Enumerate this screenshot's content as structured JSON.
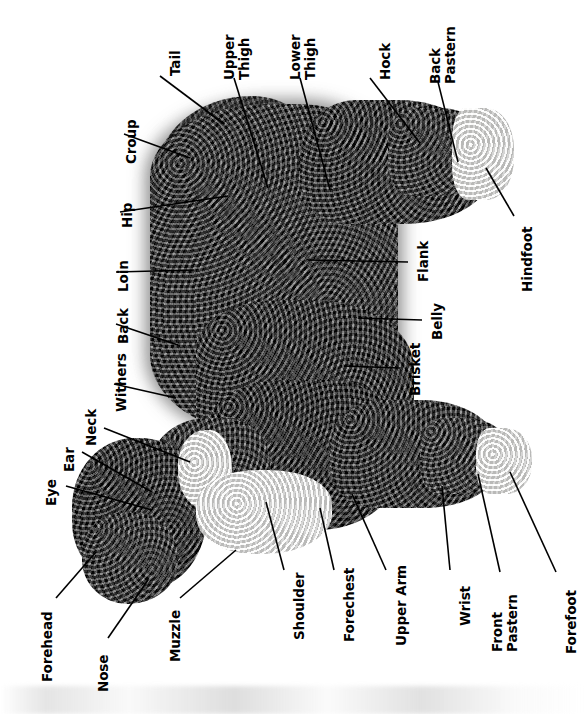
{
  "diagram": {
    "orientation": "rotated-90",
    "background_color": "#ffffff",
    "label_color": "#000000",
    "leader_color": "#000000"
  },
  "labels": [
    {
      "id": "tail",
      "lines": [
        "Tail"
      ],
      "text": "Tail"
    },
    {
      "id": "upper-thigh",
      "lines": [
        "Upper",
        "Thigh"
      ],
      "text": "Upper Thigh"
    },
    {
      "id": "lower-thigh",
      "lines": [
        "Lower",
        "Thigh"
      ],
      "text": "Lower Thigh"
    },
    {
      "id": "hock",
      "lines": [
        "Hock"
      ],
      "text": "Hock"
    },
    {
      "id": "back-pastern",
      "lines": [
        "Back",
        "Pastern"
      ],
      "text": "Back Pastern"
    },
    {
      "id": "croup",
      "lines": [
        "Croup"
      ],
      "text": "Croup"
    },
    {
      "id": "hip",
      "lines": [
        "Hip"
      ],
      "text": "Hip"
    },
    {
      "id": "loin",
      "lines": [
        "Loin"
      ],
      "text": "Loin"
    },
    {
      "id": "back",
      "lines": [
        "Back"
      ],
      "text": "Back"
    },
    {
      "id": "withers",
      "lines": [
        "Withers"
      ],
      "text": "Withers"
    },
    {
      "id": "neck",
      "lines": [
        "Neck"
      ],
      "text": "Neck"
    },
    {
      "id": "ear",
      "lines": [
        "Ear"
      ],
      "text": "Ear"
    },
    {
      "id": "eye",
      "lines": [
        "Eye"
      ],
      "text": "Eye"
    },
    {
      "id": "forehead",
      "lines": [
        "Forehead"
      ],
      "text": "Forehead"
    },
    {
      "id": "nose",
      "lines": [
        "Nose"
      ],
      "text": "Nose"
    },
    {
      "id": "muzzle",
      "lines": [
        "Muzzle"
      ],
      "text": "Muzzle"
    },
    {
      "id": "flank",
      "lines": [
        "Flank"
      ],
      "text": "Flank"
    },
    {
      "id": "hindfoot",
      "lines": [
        "Hindfoot"
      ],
      "text": "Hindfoot"
    },
    {
      "id": "belly",
      "lines": [
        "Belly"
      ],
      "text": "Belly"
    },
    {
      "id": "brisket",
      "lines": [
        "Brisket"
      ],
      "text": "Brisket"
    },
    {
      "id": "shoulder",
      "lines": [
        "Shoulder"
      ],
      "text": "Shoulder"
    },
    {
      "id": "forechest",
      "lines": [
        "Forechest"
      ],
      "text": "Forechest"
    },
    {
      "id": "upper-arm",
      "lines": [
        "Upper Arm"
      ],
      "text": "Upper Arm"
    },
    {
      "id": "wrist",
      "lines": [
        "Wrist"
      ],
      "text": "Wrist"
    },
    {
      "id": "front-pastern",
      "lines": [
        "Front",
        "Pastern"
      ],
      "text": "Front Pastern"
    },
    {
      "id": "forefoot",
      "lines": [
        "Forefoot"
      ],
      "text": "Forefoot"
    }
  ]
}
